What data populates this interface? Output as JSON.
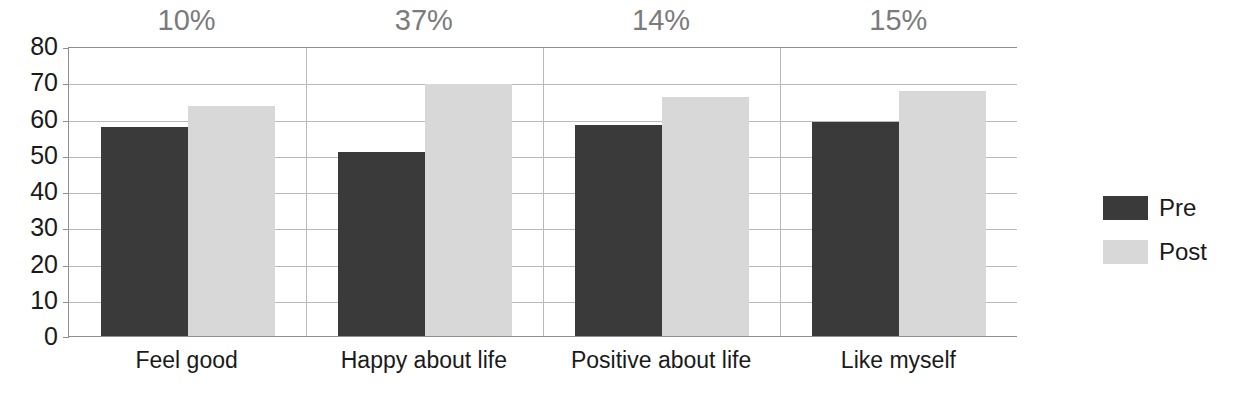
{
  "chart_data": {
    "type": "bar",
    "title": "",
    "subtitle": "",
    "xlabel": "",
    "ylabel": "",
    "ylim": [
      0,
      80
    ],
    "ytick_step": 10,
    "yticks": [
      80,
      70,
      60,
      50,
      40,
      30,
      20,
      10,
      0
    ],
    "grid": true,
    "legend_position": "right",
    "categories": [
      "Feel good",
      "Happy about life",
      "Positive about life",
      "Like myself"
    ],
    "series": [
      {
        "name": "Pre",
        "color": "#3a3a3a",
        "values": [
          58,
          51,
          58.5,
          59.5
        ]
      },
      {
        "name": "Post",
        "color": "#d8d8d8",
        "values": [
          64,
          70,
          66.5,
          68
        ]
      }
    ],
    "annotations": [
      "10%",
      "37%",
      "14%",
      "15%"
    ],
    "annotation_color": "#7b7b7b"
  },
  "legend": {
    "items": [
      {
        "label": "Pre",
        "color": "#3a3a3a"
      },
      {
        "label": "Post",
        "color": "#d8d8d8"
      }
    ]
  },
  "axis": {
    "y_labels": [
      "80",
      "70",
      "60",
      "50",
      "40",
      "30",
      "20",
      "10",
      "0"
    ]
  }
}
